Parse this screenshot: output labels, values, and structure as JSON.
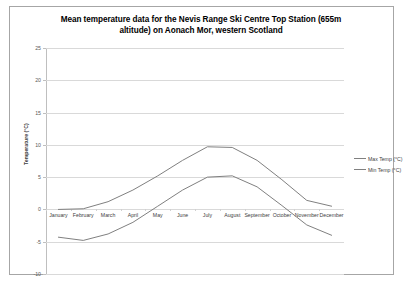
{
  "chart_data": {
    "type": "line",
    "title": "Mean temperature data for the Nevis Range Ski Centre Top Station (655m altitude) on Aonach Mor, western Scotland",
    "title_line1": "Mean temperature data for the Nevis Range Ski Centre Top Station (655m",
    "title_line2": "altitude) on Aonach Mor, western Scotland",
    "xlabel": "",
    "ylabel": "Temperature (°C)",
    "categories": [
      "January",
      "February",
      "March",
      "April",
      "May",
      "June",
      "July",
      "August",
      "September",
      "October",
      "November",
      "December"
    ],
    "series": [
      {
        "name": "Max Temp (°C)",
        "color": "#808080",
        "values": [
          0.0,
          0.1,
          1.2,
          3.0,
          5.2,
          7.6,
          9.7,
          9.6,
          7.6,
          4.6,
          1.4,
          0.5
        ]
      },
      {
        "name": "Min Temp (°C)",
        "color": "#808080",
        "values": [
          -4.3,
          -4.8,
          -3.8,
          -2.0,
          0.5,
          3.0,
          5.0,
          5.2,
          3.5,
          0.6,
          -2.4,
          -4.0
        ]
      }
    ],
    "ylim": [
      -10,
      25
    ],
    "yticks": [
      25,
      20,
      15,
      10,
      5,
      0,
      -5,
      -10
    ],
    "grid": true,
    "legend_position": "right"
  },
  "legend": {
    "entries": [
      {
        "label": "Max Temp (°C)"
      },
      {
        "label": "Min Temp (°C)"
      }
    ]
  }
}
